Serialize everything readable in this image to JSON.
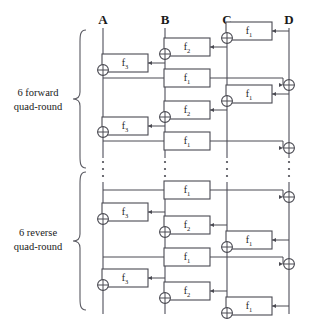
{
  "diagram": {
    "width": 312,
    "height": 329,
    "wire_labels": [
      {
        "name": "A",
        "x": 103
      },
      {
        "name": "B",
        "x": 165
      },
      {
        "name": "C",
        "x": 227
      },
      {
        "name": "D",
        "x": 289
      }
    ],
    "group_labels": [
      {
        "line1": "6 forward",
        "line2": "quad-round",
        "x": 38,
        "y1": 96,
        "y2": 110
      },
      {
        "line1": "6 reverse",
        "line2": "quad-round",
        "x": 38,
        "y1": 236,
        "y2": 250
      }
    ],
    "function_boxes": [
      {
        "label": "f",
        "sub": "1",
        "x": 249,
        "y": 31
      },
      {
        "label": "f",
        "sub": "2",
        "x": 187,
        "y": 47
      },
      {
        "label": "f",
        "sub": "3",
        "x": 125,
        "y": 63
      },
      {
        "label": "f",
        "sub": "1",
        "x": 187,
        "y": 78
      },
      {
        "label": "f",
        "sub": "1",
        "x": 249,
        "y": 94
      },
      {
        "label": "f",
        "sub": "2",
        "x": 187,
        "y": 110
      },
      {
        "label": "f",
        "sub": "3",
        "x": 125,
        "y": 126
      },
      {
        "label": "f",
        "sub": "1",
        "x": 187,
        "y": 141
      },
      {
        "label": "f",
        "sub": "1",
        "x": 187,
        "y": 190
      },
      {
        "label": "f",
        "sub": "3",
        "x": 125,
        "y": 212
      },
      {
        "label": "f",
        "sub": "2",
        "x": 187,
        "y": 225
      },
      {
        "label": "f",
        "sub": "1",
        "x": 249,
        "y": 240
      },
      {
        "label": "f",
        "sub": "1",
        "x": 187,
        "y": 257
      },
      {
        "label": "f",
        "sub": "3",
        "x": 125,
        "y": 278
      },
      {
        "label": "f",
        "sub": "2",
        "x": 187,
        "y": 291
      },
      {
        "label": "f",
        "sub": "1",
        "x": 249,
        "y": 306
      }
    ],
    "xor_nodes": [
      {
        "wire": "C",
        "x": 227,
        "y": 38
      },
      {
        "wire": "B",
        "x": 165,
        "y": 54
      },
      {
        "wire": "A",
        "x": 103,
        "y": 70
      },
      {
        "wire": "D",
        "x": 289,
        "y": 85
      },
      {
        "wire": "C",
        "x": 227,
        "y": 101
      },
      {
        "wire": "B",
        "x": 165,
        "y": 117
      },
      {
        "wire": "A",
        "x": 103,
        "y": 132
      },
      {
        "wire": "D",
        "x": 289,
        "y": 148
      },
      {
        "wire": "D",
        "x": 289,
        "y": 197
      },
      {
        "wire": "A",
        "x": 103,
        "y": 219
      },
      {
        "wire": "B",
        "x": 165,
        "y": 232
      },
      {
        "wire": "C",
        "x": 227,
        "y": 247
      },
      {
        "wire": "D",
        "x": 289,
        "y": 264
      },
      {
        "wire": "A",
        "x": 103,
        "y": 285
      },
      {
        "wire": "B",
        "x": 165,
        "y": 298
      },
      {
        "wire": "C",
        "x": 227,
        "y": 313
      }
    ],
    "ellipsis_columns": [
      103,
      165,
      227,
      289
    ],
    "ellipsis_y_range": [
      160,
      180
    ],
    "braces": [
      {
        "name": "forward-brace",
        "top": 30,
        "bottom": 168
      },
      {
        "name": "reverse-brace",
        "top": 172,
        "bottom": 312
      }
    ],
    "colors": {
      "line": "#4a4a52",
      "wire": "#6a6a74",
      "background": "#ffffff",
      "text": "#1a1a1a"
    }
  }
}
